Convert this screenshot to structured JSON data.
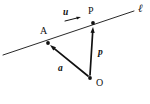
{
  "figure": {
    "kind": "vector-geometry-diagram",
    "background_color": "#ffffff",
    "stroke_color": "#111111",
    "width": 150,
    "height": 104,
    "line": {
      "name": "l",
      "label": "ℓ",
      "label_x": 138,
      "label_y": 3,
      "x1": 3,
      "y1": 55,
      "x2": 134,
      "y2": 11,
      "stroke_width": 0.9
    },
    "points": [
      {
        "id": "A",
        "label": "A",
        "x": 48,
        "y": 43,
        "label_x": 40,
        "label_y": 26,
        "dot_r": 1.9
      },
      {
        "id": "P",
        "label": "P",
        "x": 93,
        "y": 23,
        "label_x": 88,
        "label_y": 6,
        "dot_r": 1.9
      },
      {
        "id": "O",
        "label": "O",
        "x": 90,
        "y": 78,
        "label_x": 96,
        "label_y": 78,
        "dot_r": 1.9
      }
    ],
    "vectors": [
      {
        "id": "a",
        "label": "a",
        "from": "O",
        "to": "A",
        "x1": 88,
        "y1": 76,
        "x2": 50,
        "y2": 45,
        "label_x": 58,
        "label_y": 64,
        "stroke_width": 1.7,
        "head_len": 6,
        "head_w": 4.2
      },
      {
        "id": "p",
        "label": "p",
        "from": "O",
        "to": "P",
        "x1": 90,
        "y1": 75,
        "x2": 93,
        "y2": 27,
        "label_x": 98,
        "label_y": 48,
        "stroke_width": 1.7,
        "head_len": 6,
        "head_w": 4.2
      },
      {
        "id": "u",
        "label": "u",
        "from": "",
        "to": "",
        "x1": 65,
        "y1": 21,
        "x2": 81,
        "y2": 17,
        "label_x": 63,
        "label_y": 8,
        "stroke_width": 1.0,
        "head_len": 4.5,
        "head_w": 3.0
      }
    ]
  }
}
